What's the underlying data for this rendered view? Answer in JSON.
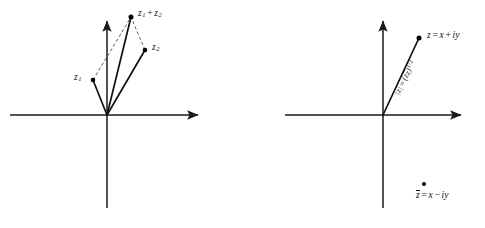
{
  "figure": {
    "background_color": "#ffffff",
    "stroke_color": "#1a1a1a",
    "dash_color": "#555555",
    "panels": [
      {
        "name": "vector-addition",
        "origin": [
          107,
          115
        ],
        "axes": {
          "real_axis": {
            "from": [
              10,
              115
            ],
            "to": [
              205,
              115
            ],
            "arrow": "right"
          },
          "imag_axis": {
            "from": [
              107,
              208
            ],
            "to": [
              107,
              14
            ],
            "arrow": "up"
          }
        },
        "vectors": [
          {
            "label": "z1",
            "tip": [
              93,
              80
            ],
            "style": "solid"
          },
          {
            "label": "z2",
            "tip": [
              145,
              50
            ],
            "style": "solid"
          },
          {
            "label": "z1plusz2",
            "tip": [
              131,
              17
            ],
            "style": "solid"
          }
        ],
        "dashed_edges": [
          {
            "from": [
              93,
              80
            ],
            "to": [
              131,
              17
            ]
          },
          {
            "from": [
              145,
              50
            ],
            "to": [
              131,
              17
            ]
          }
        ],
        "labels": {
          "z1": {
            "base": "z",
            "sub": "1"
          },
          "z2": {
            "base": "z",
            "sub": "2"
          },
          "sum": {
            "left": "z",
            "left_sub": "1",
            "operator": "+",
            "right": "z",
            "right_sub": "2"
          }
        }
      },
      {
        "name": "modulus-conjugate",
        "origin": [
          383,
          115
        ],
        "axes": {
          "real_axis": {
            "from": [
              285,
              115
            ],
            "to": [
              468,
              115
            ],
            "arrow": "right"
          },
          "imag_axis": {
            "from": [
              383,
              208
            ],
            "to": [
              383,
              14
            ],
            "arrow": "up"
          }
        },
        "vectors": [
          {
            "label": "z",
            "tip": [
              419,
              38
            ],
            "style": "solid"
          }
        ],
        "labels": {
          "modulus": {
            "lhs": "|z| ",
            "eq": "=",
            "rhs_open": "(z",
            "rhs_conj": "z",
            "rhs_close": ")",
            "exponent": "1/2"
          },
          "point": {
            "lhs": "z",
            "eq": "=",
            "rhs": "x + iy"
          },
          "conjugate": {
            "lhs": "z",
            "eq": "=",
            "rhs": "x − iy"
          }
        },
        "conjugate_marker": {
          "at": [
            424,
            183
          ]
        }
      }
    ]
  },
  "text": {
    "z1": "z",
    "z1_sub": "1",
    "z2": "z",
    "z2_sub": "2",
    "sum_left": "z",
    "sum_left_sub": "1",
    "sum_op": "+",
    "sum_right": "z",
    "sum_right_sub": "2",
    "modulus_lhs": "|z|",
    "modulus_eq": "=",
    "modulus_open": "(z",
    "modulus_conj": "z",
    "modulus_close": ")",
    "modulus_exp": "1/2",
    "point_lhs": "z",
    "point_eq": "=",
    "point_rhs_a": "x",
    "point_rhs_op": "+",
    "point_rhs_b": "iy",
    "conj_lhs": "z",
    "conj_eq": "=",
    "conj_rhs_a": "x",
    "conj_rhs_op": "−",
    "conj_rhs_b": "iy"
  }
}
